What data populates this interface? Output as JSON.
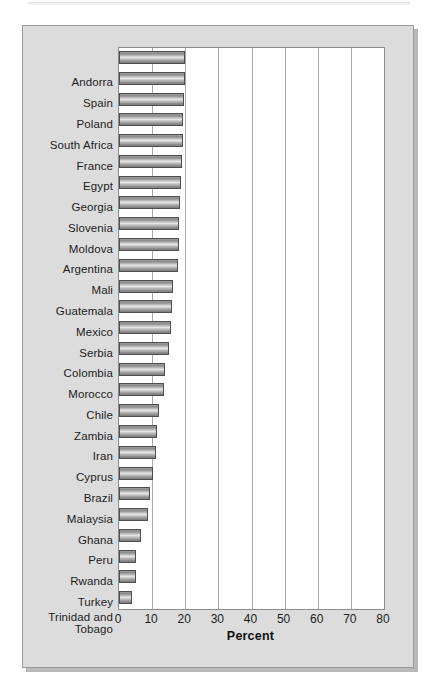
{
  "chart_data": {
    "type": "bar",
    "orientation": "horizontal",
    "title": "",
    "xlabel": "Percent",
    "ylabel": "",
    "xlim": [
      0,
      80
    ],
    "xticks": [
      0,
      10,
      20,
      30,
      40,
      50,
      60,
      70,
      80
    ],
    "grid": true,
    "legend": false,
    "categories": [
      "Andorra",
      "Spain",
      "Poland",
      "South Africa",
      "France",
      "Egypt",
      "Georgia",
      "Slovenia",
      "Moldova",
      "Argentina",
      "Mali",
      "Guatemala",
      "Mexico",
      "Serbia",
      "Colombia",
      "Morocco",
      "Chile",
      "Zambia",
      "Iran",
      "Cyprus",
      "Brazil",
      "Malaysia",
      "Ghana",
      "Peru",
      "Rwanda",
      "Turkey",
      "Trinidad and Tobago"
    ],
    "values": [
      20.0,
      20.0,
      19.5,
      19.3,
      19.2,
      19.0,
      18.8,
      18.5,
      18.2,
      18.0,
      17.8,
      16.2,
      16.0,
      15.8,
      15.0,
      13.8,
      13.5,
      12.2,
      11.5,
      11.3,
      10.2,
      9.5,
      8.8,
      6.6,
      5.2,
      5.0,
      4.0
    ]
  },
  "axis": {
    "x_title": "Percent",
    "tick_labels": [
      "0",
      "10",
      "20",
      "30",
      "40",
      "50",
      "60",
      "70",
      "80"
    ]
  },
  "style": {
    "panel_background": "#dcdcdc",
    "plot_background": "#ffffff",
    "bar_border": "#4e4e4e",
    "gridline": "#a9a9a9",
    "text": "#1c1c1c"
  }
}
